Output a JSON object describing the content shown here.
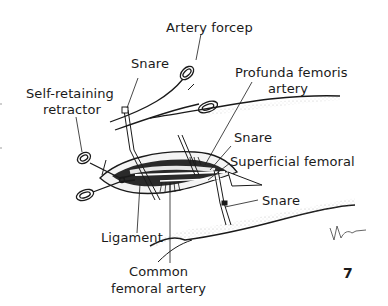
{
  "figure": {
    "number": "7",
    "signature": "Martin"
  },
  "labels": {
    "artery_forcep": "Artery forcep",
    "snare_top": "Snare",
    "self_retaining_1": "Self-retaining",
    "self_retaining_2": "retractor",
    "profunda_1": "Profunda femoris",
    "profunda_2": "artery",
    "snare_mid": "Snare",
    "superficial_femoral": "Superficial femoral",
    "snare_low": "Snare",
    "ligament": "Ligament",
    "common_1": "Common",
    "common_2": "femoral artery"
  },
  "colors": {
    "ink": "#1a1a1a",
    "background": "#ffffff",
    "stipple": "#9a9a9a"
  }
}
